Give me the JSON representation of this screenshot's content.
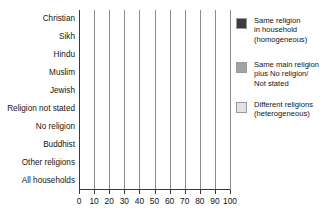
{
  "chart_data": {
    "type": "bar",
    "orientation": "horizontal",
    "stacked": true,
    "title": "",
    "xlabel": "",
    "ylabel": "",
    "xlim": [
      0,
      100
    ],
    "xticks": [
      0,
      10,
      20,
      30,
      40,
      50,
      60,
      70,
      80,
      90,
      100
    ],
    "grid": true,
    "legend_position": "right",
    "categories": [
      "Christian",
      "Sikh",
      "Hindu",
      "Muslim",
      "Jewish",
      "Religion not stated",
      "No religion",
      "Buddhist",
      "Other religions",
      "All households"
    ],
    "series": [
      {
        "name": "Same religion in household (homogeneous)",
        "color": "#3c3c3c",
        "values": [
          79,
          83,
          80,
          80,
          79,
          73,
          78,
          71,
          60,
          78
        ]
      },
      {
        "name": "Same main religion plus No religion/ Not stated",
        "color": "#a3a3a3",
        "values": [
          2,
          5,
          4,
          5,
          1,
          6,
          3,
          14,
          15,
          4
        ]
      },
      {
        "name": "Different religions (heterogeneous)",
        "color": "#e2e2e2",
        "values": [
          19,
          12,
          16,
          15,
          20,
          21,
          19,
          15,
          25,
          18
        ]
      }
    ]
  },
  "legend": {
    "items": [
      {
        "swatch_color": "#3c3c3c",
        "lines": [
          "Same religion",
          "in household",
          "(homogeneous)"
        ]
      },
      {
        "swatch_color": "#a3a3a3",
        "lines": [
          "Same main religion",
          "plus No religion/",
          "Not stated"
        ]
      },
      {
        "swatch_color": "#e2e2e2",
        "lines": [
          "Different religions",
          "(heterogeneous)"
        ]
      }
    ]
  }
}
